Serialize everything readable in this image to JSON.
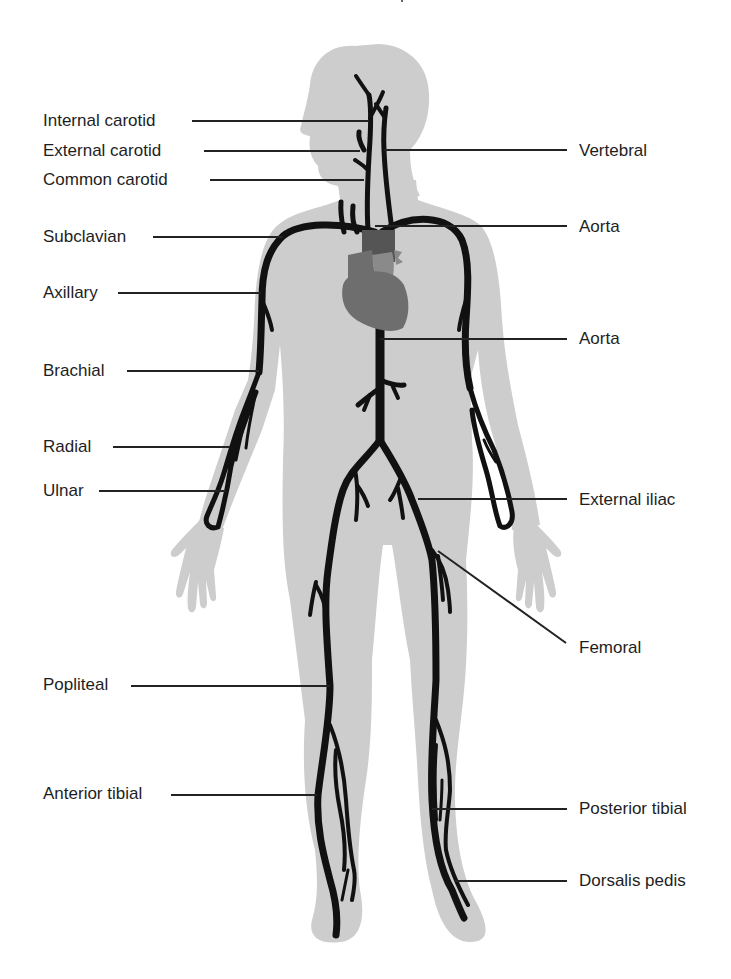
{
  "figure": {
    "colors": {
      "body_silhouette": "#cdcdcd",
      "artery": "#111111",
      "heart_light": "#8a8a8a",
      "heart_mid": "#6e6e6e",
      "heart_dark": "#555555",
      "leader_line": "#222222",
      "text": "#1e1e1e"
    }
  },
  "labels_left": [
    {
      "text": "Internal carotid",
      "x": 43,
      "y": 111,
      "line": [
        192,
        121,
        368,
        121
      ]
    },
    {
      "text": "External carotid",
      "x": 43,
      "y": 141,
      "line": [
        204,
        151,
        360,
        151
      ]
    },
    {
      "text": "Common carotid",
      "x": 43,
      "y": 170,
      "line": [
        210,
        180,
        364,
        180
      ]
    },
    {
      "text": "Subclavian",
      "x": 43,
      "y": 227,
      "line": [
        153,
        237,
        283,
        237
      ]
    },
    {
      "text": "Axillary",
      "x": 43,
      "y": 283,
      "line": [
        118,
        293,
        261,
        293
      ]
    },
    {
      "text": "Brachial",
      "x": 43,
      "y": 361,
      "line": [
        127,
        371,
        259,
        371
      ]
    },
    {
      "text": "Radial",
      "x": 43,
      "y": 437,
      "line": [
        113,
        447,
        230,
        447
      ]
    },
    {
      "text": "Ulnar",
      "x": 43,
      "y": 481,
      "line": [
        99,
        491,
        226,
        491
      ]
    },
    {
      "text": "Popliteal",
      "x": 43,
      "y": 675,
      "line": [
        131,
        686,
        330,
        686
      ]
    },
    {
      "text": "Anterior tibial",
      "x": 43,
      "y": 784,
      "line": [
        171,
        795,
        317,
        795
      ]
    }
  ],
  "labels_right": [
    {
      "text": "Vertebral",
      "x": 579,
      "y": 141,
      "line": [
        384,
        150,
        567,
        150
      ]
    },
    {
      "text": "Aorta",
      "x": 579,
      "y": 217,
      "line": [
        375,
        226,
        567,
        226
      ]
    },
    {
      "text": "Aorta",
      "x": 579,
      "y": 329,
      "line": [
        380,
        339,
        567,
        339
      ]
    },
    {
      "text": "External iliac",
      "x": 579,
      "y": 490,
      "line": [
        418,
        499,
        567,
        499
      ]
    },
    {
      "text": "Femoral",
      "x": 579,
      "y": 638,
      "line": [
        438,
        551,
        566,
        643
      ]
    },
    {
      "text": "Posterior tibial",
      "x": 579,
      "y": 799,
      "line": [
        432,
        809,
        567,
        809
      ]
    },
    {
      "text": "Dorsalis pedis",
      "x": 579,
      "y": 871,
      "line": [
        455,
        881,
        567,
        881
      ]
    }
  ]
}
